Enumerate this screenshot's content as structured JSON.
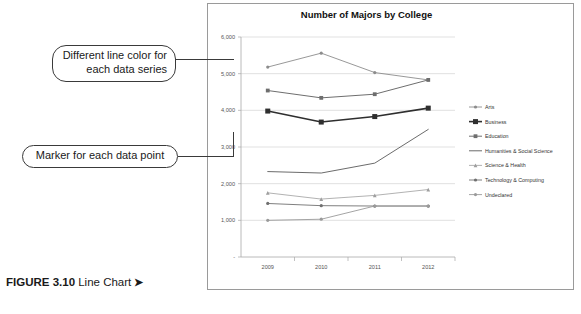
{
  "figure": {
    "label": "FIGURE 3.10",
    "text": " Line Chart ",
    "arrow": "➤"
  },
  "annotations": [
    {
      "id": "callout-color",
      "text": "Different line color for each data series"
    },
    {
      "id": "callout-marker",
      "text": "Marker for each data point"
    }
  ],
  "ghost_text": {
    "title": "Create Other Charts",
    "line1": "lorem ipsum dolor sit amet consectetur",
    "line2": "adipiscing elit sed do eiusmod tempor",
    "line3": "Insert a Chart"
  },
  "chart_data": {
    "type": "line",
    "title": "Number of Majors by College",
    "xlabel": "",
    "ylabel": "",
    "categories": [
      "2009",
      "2010",
      "2011",
      "2012"
    ],
    "x": [
      2009,
      2010,
      2011,
      2012
    ],
    "ylim": [
      0,
      6000
    ],
    "yticks": [
      0,
      1000,
      2000,
      3000,
      4000,
      5000,
      6000
    ],
    "ytick_labels": [
      "-",
      "1,000",
      "2,000",
      "3,000",
      "4,000",
      "5,000",
      "6,000"
    ],
    "grid": true,
    "legend_position": "right",
    "series": [
      {
        "name": "Arts",
        "values": [
          5180,
          5560,
          5030,
          4830
        ],
        "color": "#8c8c8c",
        "marker": "circle",
        "width": 0.9
      },
      {
        "name": "Business",
        "values": [
          3980,
          3680,
          3830,
          4060
        ],
        "color": "#2f2f2f",
        "marker": "square",
        "width": 1.6
      },
      {
        "name": "Education",
        "values": [
          4540,
          4340,
          4440,
          4830
        ],
        "color": "#6e6e6e",
        "marker": "square",
        "width": 1.0
      },
      {
        "name": "Humanities & Social Science",
        "values": [
          2330,
          2290,
          2560,
          3480
        ],
        "color": "#5a5a5a",
        "marker": "none",
        "width": 0.9
      },
      {
        "name": "Science & Health",
        "values": [
          1750,
          1580,
          1680,
          1840
        ],
        "color": "#9e9e9e",
        "marker": "triangle",
        "width": 0.8
      },
      {
        "name": "Technology & Computing",
        "values": [
          1460,
          1400,
          1390,
          1390
        ],
        "color": "#707070",
        "marker": "circle",
        "width": 0.9
      },
      {
        "name": "Undeclared",
        "values": [
          1000,
          1030,
          1390,
          1390
        ],
        "color": "#9a9a9a",
        "marker": "circle",
        "width": 0.9
      }
    ]
  }
}
